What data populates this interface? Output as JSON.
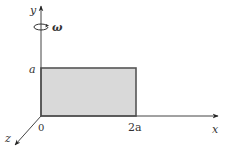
{
  "diagram": {
    "axes": {
      "x_label": "x",
      "y_label": "y",
      "z_label": "z",
      "origin_label": "0"
    },
    "ticks": {
      "y_tick": "a",
      "x_tick": "2a"
    },
    "rotation": {
      "symbol": "ω",
      "axis": "y"
    },
    "plate": {
      "width_label": "2a",
      "height_label": "a",
      "fill_color": "#d9d9d9",
      "stroke_color": "#555555"
    },
    "colors": {
      "axis": "#444444",
      "text": "#333333"
    }
  }
}
